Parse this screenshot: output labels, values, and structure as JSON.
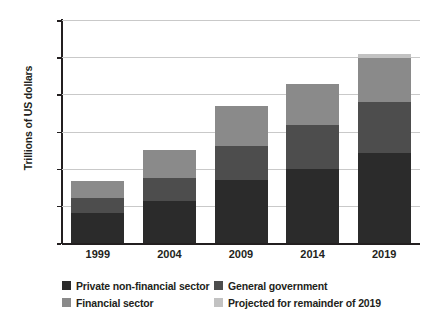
{
  "chart_data": {
    "type": "bar",
    "stacked": true,
    "title": "",
    "xlabel": "",
    "ylabel": "Trillions of US dollars",
    "categories": [
      "1999",
      "2004",
      "2009",
      "2014",
      "2019"
    ],
    "ylim": [
      0,
      300
    ],
    "yticks": [
      0,
      50,
      100,
      150,
      200,
      250,
      300
    ],
    "ytick_labels": [
      "0",
      "50",
      "100",
      "150",
      "200",
      "250",
      "300"
    ],
    "grid": true,
    "legend_position": "bottom",
    "series": [
      {
        "name": "Private non-financial sector",
        "color": "#2b2b2b",
        "values": [
          40,
          57,
          85,
          99,
          121
        ]
      },
      {
        "name": "General government",
        "color": "#4d4d4d",
        "values": [
          20,
          31,
          46,
          60,
          69
        ]
      },
      {
        "name": "Financial sector",
        "color": "#8a8a8a",
        "values": [
          24,
          37,
          54,
          55,
          59
        ]
      },
      {
        "name": "Projected for remainder of 2019",
        "color": "#c2c2c2",
        "values": [
          0,
          0,
          0,
          0,
          5
        ]
      }
    ],
    "totals": [
      84,
      125,
      185,
      214,
      254
    ]
  },
  "legend": {
    "items": [
      {
        "label": "Private non-financial sector",
        "color": "#2b2b2b"
      },
      {
        "label": "General government",
        "color": "#4d4d4d"
      },
      {
        "label": "Financial sector",
        "color": "#8a8a8a"
      },
      {
        "label": "Projected for remainder of 2019",
        "color": "#c2c2c2"
      }
    ]
  },
  "axis": {
    "y_title": "Trillions of US dollars"
  }
}
